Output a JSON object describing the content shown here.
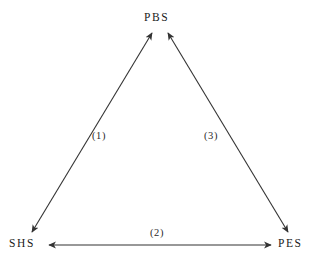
{
  "diagram": {
    "type": "triangle-relationship-diagram",
    "background_color": "#ffffff",
    "line_color": "#333333",
    "text_color": "#1a1a1a",
    "nodes": [
      {
        "id": "pbs",
        "label": "PBS",
        "position": "top"
      },
      {
        "id": "shs",
        "label": "SHS",
        "position": "bottom-left"
      },
      {
        "id": "pes",
        "label": "PES",
        "position": "bottom-right"
      }
    ],
    "edges": [
      {
        "id": "edge1",
        "label": "(1)",
        "from": "SHS",
        "to": "PBS",
        "arrows": "both"
      },
      {
        "id": "edge2",
        "label": "(2)",
        "from": "SHS",
        "to": "PES",
        "arrows": "both"
      },
      {
        "id": "edge3",
        "label": "(3)",
        "from": "PES",
        "to": "PBS",
        "arrows": "both"
      }
    ]
  }
}
